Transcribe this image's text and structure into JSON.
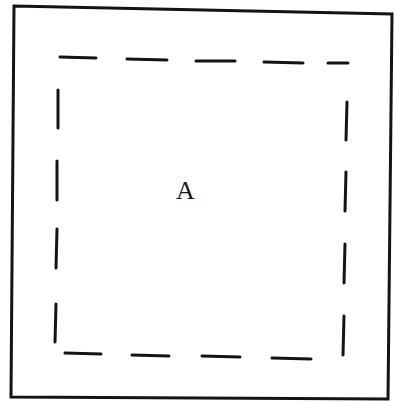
{
  "diagram": {
    "region_label": "A",
    "colors": {
      "stroke": "#141414",
      "background": "#ffffff"
    },
    "outer_border": {
      "shape": "quadrilateral",
      "points": [
        [
          14,
          6
        ],
        [
          392,
          14
        ],
        [
          388,
          399
        ],
        [
          11,
          397
        ]
      ]
    },
    "inner_dashed_boundary": {
      "top_dashes": [
        [
          [
            60,
            57
          ],
          [
            96,
            58
          ]
        ],
        [
          [
            127,
            59
          ],
          [
            167,
            60
          ]
        ],
        [
          [
            196,
            61
          ],
          [
            235,
            61
          ]
        ],
        [
          [
            264,
            62
          ],
          [
            303,
            63
          ]
        ],
        [
          [
            328,
            63
          ],
          [
            348,
            63
          ]
        ]
      ],
      "right_dashes": [
        [
          [
            347,
            102
          ],
          [
            346,
            140
          ]
        ],
        [
          [
            346,
            172
          ],
          [
            345,
            211
          ]
        ],
        [
          [
            345,
            244
          ],
          [
            344,
            283
          ]
        ],
        [
          [
            344,
            316
          ],
          [
            343,
            355
          ]
        ]
      ],
      "bottom_dashes": [
        [
          [
            65,
            353
          ],
          [
            101,
            354
          ]
        ],
        [
          [
            132,
            355
          ],
          [
            169,
            356
          ]
        ],
        [
          [
            202,
            356
          ],
          [
            240,
            357
          ]
        ],
        [
          [
            272,
            358
          ],
          [
            311,
            359
          ]
        ]
      ],
      "left_dashes": [
        [
          [
            58,
            90
          ],
          [
            58,
            128
          ]
        ],
        [
          [
            57,
            161
          ],
          [
            57,
            200
          ]
        ],
        [
          [
            57,
            229
          ],
          [
            56,
            268
          ]
        ],
        [
          [
            56,
            304
          ],
          [
            55,
            342
          ]
        ]
      ]
    }
  }
}
